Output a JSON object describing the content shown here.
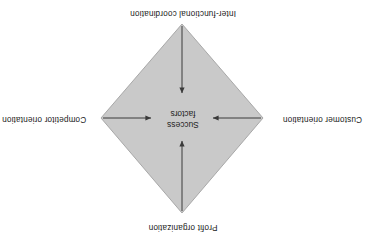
{
  "diagram": {
    "orientation_degrees": 180,
    "shape": "diamond",
    "center": {
      "line1": "Success",
      "line2": "factors"
    },
    "nodes": [
      {
        "id": "profit",
        "label": "Profit organization",
        "position": "top",
        "arrow": "points-to-center"
      },
      {
        "id": "customer",
        "label": "Customer orientation",
        "position": "right",
        "arrow": "points-to-center"
      },
      {
        "id": "competitor",
        "label": "Competitor orientation",
        "position": "left",
        "arrow": "points-to-center"
      },
      {
        "id": "inter-functional",
        "label": "Inter-functional coordination",
        "position": "bottom",
        "arrow": "points-to-center"
      }
    ],
    "colors": {
      "diamond_fill": "#c9c9c9",
      "diamond_stroke": "#a8a8a8",
      "arrow": "#3a3a3a",
      "text": "#222222",
      "background": "#ffffff"
    }
  }
}
